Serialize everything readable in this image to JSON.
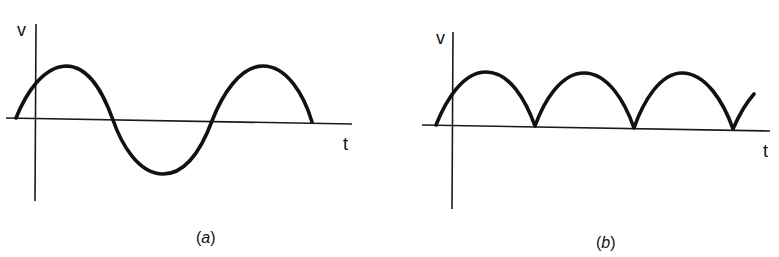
{
  "figure": {
    "panels": [
      {
        "id": "a",
        "caption_open": "(",
        "caption_letter": "a",
        "caption_close": ")",
        "y_axis_label": "v",
        "x_axis_label": "t",
        "waveform": "sine (alternating)"
      },
      {
        "id": "b",
        "caption_open": "(",
        "caption_letter": "b",
        "caption_close": ")",
        "y_axis_label": "v",
        "x_axis_label": "t",
        "waveform": "full-wave rectified sine"
      }
    ]
  },
  "colors": {
    "ink": "#111111",
    "background": "#ffffff"
  }
}
